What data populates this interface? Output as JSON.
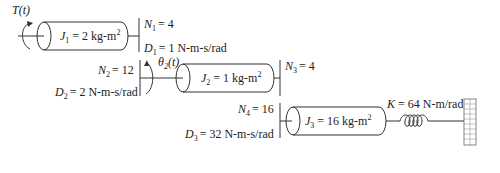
{
  "diagram": {
    "type": "rotational gear train",
    "input": {
      "torque_label": "T(t)"
    },
    "inertias": [
      {
        "symbol": "J",
        "index": "1",
        "value": "= 2 kg-m",
        "exp": "2"
      },
      {
        "symbol": "J",
        "index": "2",
        "value": "= 1 kg-m",
        "exp": "2"
      },
      {
        "symbol": "J",
        "index": "3",
        "value": "= 16 kg-m",
        "exp": "2"
      }
    ],
    "gears": [
      {
        "symbol": "N",
        "index": "1",
        "value": "= 4"
      },
      {
        "symbol": "N",
        "index": "2",
        "value": "= 12"
      },
      {
        "symbol": "N",
        "index": "3",
        "value": "= 4"
      },
      {
        "symbol": "N",
        "index": "4",
        "value": "= 16"
      }
    ],
    "dampers": [
      {
        "symbol": "D",
        "index": "1",
        "value": "=  1 N-m-s/rad"
      },
      {
        "symbol": "D",
        "index": "2",
        "value": "= 2 N-m-s/rad"
      },
      {
        "symbol": "D",
        "index": "3",
        "value": "= 32 N-m-s/rad"
      }
    ],
    "output": {
      "angle_symbol": "θ",
      "angle_index": "2",
      "angle_arg": "(t)"
    },
    "spring": {
      "symbol": "K",
      "value": "= 64 N-m/rad"
    },
    "ground": {
      "icon": "wall-hatch-icon"
    }
  }
}
